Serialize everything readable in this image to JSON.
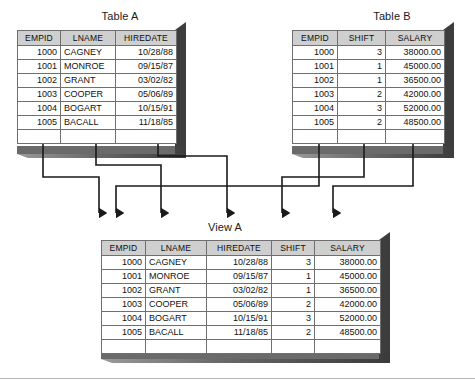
{
  "figure": {
    "kind": "database-join-view-diagram",
    "background_color": "#ffffff",
    "header_fill": "#cfcfcf",
    "table_border_color": "#3b3b3b",
    "grid_line_color": "#6f6f6f",
    "shadow_dark": "#3a3a3a",
    "shadow_mid": "#6d6d6d",
    "connector_color": "#1a1a1a"
  },
  "tables": [
    {
      "id": "table-a",
      "title": "Table A",
      "columns": [
        "EMPID",
        "LNAME",
        "HIREDATE"
      ],
      "column_align": [
        "num",
        "txt",
        "num"
      ],
      "rows": [
        [
          "1000",
          "CAGNEY",
          "10/28/88"
        ],
        [
          "1001",
          "MONROE",
          "09/15/87"
        ],
        [
          "1002",
          "GRANT",
          "03/02/82"
        ],
        [
          "1003",
          "COOPER",
          "05/06/89"
        ],
        [
          "1004",
          "BOGART",
          "10/15/91"
        ],
        [
          "1005",
          "BACALL",
          "11/18/85"
        ]
      ]
    },
    {
      "id": "table-b",
      "title": "Table B",
      "columns": [
        "EMPID",
        "SHIFT",
        "SALARY"
      ],
      "column_align": [
        "num",
        "num",
        "num"
      ],
      "rows": [
        [
          "1000",
          "3",
          "38000.00"
        ],
        [
          "1001",
          "1",
          "45000.00"
        ],
        [
          "1002",
          "1",
          "36500.00"
        ],
        [
          "1003",
          "2",
          "42000.00"
        ],
        [
          "1004",
          "3",
          "52000.00"
        ],
        [
          "1005",
          "2",
          "48500.00"
        ]
      ]
    },
    {
      "id": "view-a",
      "title": "View A",
      "columns": [
        "EMPID",
        "LNAME",
        "HIREDATE",
        "SHIFT",
        "SALARY"
      ],
      "column_align": [
        "num",
        "txt",
        "num",
        "num",
        "num"
      ],
      "rows": [
        [
          "1000",
          "CAGNEY",
          "10/28/88",
          "3",
          "38000.00"
        ],
        [
          "1001",
          "MONROE",
          "09/15/87",
          "1",
          "45000.00"
        ],
        [
          "1002",
          "GRANT",
          "03/02/82",
          "1",
          "36500.00"
        ],
        [
          "1003",
          "COOPER",
          "05/06/89",
          "2",
          "42000.00"
        ],
        [
          "1004",
          "BOGART",
          "10/15/91",
          "3",
          "52000.00"
        ],
        [
          "1005",
          "BACALL",
          "11/18/85",
          "2",
          "48500.00"
        ]
      ]
    }
  ],
  "connectors": [
    {
      "from": "table-a.EMPID",
      "to": "view-a.EMPID"
    },
    {
      "from": "table-a.LNAME",
      "to": "view-a.LNAME"
    },
    {
      "from": "table-a.HIREDATE",
      "to": "view-a.HIREDATE"
    },
    {
      "from": "table-b.EMPID",
      "to": "view-a.EMPID"
    },
    {
      "from": "table-b.SHIFT",
      "to": "view-a.SHIFT"
    },
    {
      "from": "table-b.SALARY",
      "to": "view-a.SALARY"
    }
  ]
}
